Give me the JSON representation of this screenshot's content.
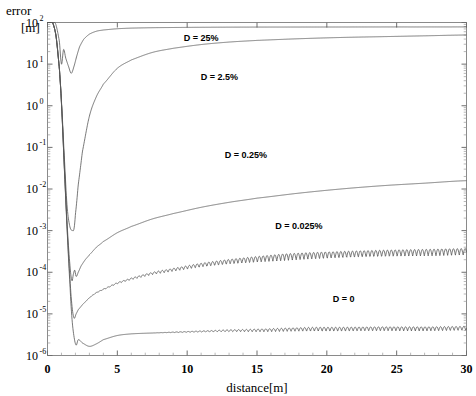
{
  "chart_data": {
    "type": "line",
    "title": "",
    "ylabel": "error",
    "yunit": "[m]",
    "xlabel": "distance[m]",
    "xlim": [
      0,
      30
    ],
    "ylim_exp": [
      -6,
      2
    ],
    "yscale": "log",
    "grid": false,
    "legend_position": "inline-annotations",
    "xticks": [
      "0",
      "5",
      "10",
      "15",
      "20",
      "25",
      "30"
    ],
    "xtick_values": [
      0,
      5,
      10,
      15,
      20,
      25,
      30
    ],
    "yticks": [
      {
        "mantissa": "10",
        "exponent": "2",
        "value": 100
      },
      {
        "mantissa": "10",
        "exponent": "1",
        "value": 10
      },
      {
        "mantissa": "10",
        "exponent": "0",
        "value": 1
      },
      {
        "mantissa": "10",
        "exponent": "-1",
        "value": 0.1
      },
      {
        "mantissa": "10",
        "exponent": "-2",
        "value": 0.01
      },
      {
        "mantissa": "10",
        "exponent": "-3",
        "value": 0.001
      },
      {
        "mantissa": "10",
        "exponent": "-4",
        "value": 0.0001
      },
      {
        "mantissa": "10",
        "exponent": "-5",
        "value": 1e-05
      },
      {
        "mantissa": "10",
        "exponent": "-6",
        "value": 1e-06
      }
    ],
    "series": [
      {
        "name": "D = 25%",
        "label": "D = 25%",
        "label_x": 11.0,
        "label_y_exp": 1.55,
        "color": "#555555",
        "x": [
          0.0,
          0.3,
          0.6,
          0.85,
          1.0,
          1.15,
          1.3,
          1.5,
          1.7,
          1.9,
          2.1,
          2.3,
          2.6,
          3.0,
          3.5,
          4.0,
          5.0,
          6.0,
          7.5,
          9.0,
          11.0,
          13.0,
          15.0,
          18.0,
          21.0,
          24.0,
          27.0,
          30.0
        ],
        "y_exp": [
          2.15,
          2.1,
          1.95,
          1.55,
          1.0,
          1.35,
          1.15,
          0.95,
          0.78,
          0.95,
          1.2,
          1.42,
          1.6,
          1.72,
          1.79,
          1.82,
          1.85,
          1.865,
          1.875,
          1.88,
          1.885,
          1.888,
          1.89,
          1.891,
          1.892,
          1.893,
          1.893,
          1.894
        ]
      },
      {
        "name": "D = 2.5%",
        "label": "D = 2.5%",
        "label_x": 12.3,
        "label_y_exp": 0.62,
        "color": "#555555",
        "x": [
          0.0,
          0.3,
          0.6,
          0.85,
          1.0,
          1.2,
          1.4,
          1.6,
          1.8,
          1.9,
          2.0,
          2.2,
          2.5,
          3.0,
          3.5,
          4.0,
          5.0,
          6.0,
          7.5,
          9.0,
          11.0,
          13.0,
          15.0,
          18.0,
          21.0,
          24.0,
          27.0,
          30.0
        ],
        "y_exp": [
          2.15,
          2.05,
          1.7,
          0.9,
          0.1,
          -1.2,
          -2.4,
          -2.9,
          -3.0,
          -2.95,
          -2.6,
          -1.9,
          -1.1,
          -0.25,
          0.22,
          0.52,
          0.9,
          1.1,
          1.28,
          1.38,
          1.47,
          1.53,
          1.57,
          1.61,
          1.64,
          1.66,
          1.68,
          1.7
        ]
      },
      {
        "name": "D = 0.25%",
        "label": "D = 0.25%",
        "label_x": 14.2,
        "label_y_exp": -1.25,
        "color": "#555555",
        "x": [
          0.0,
          0.3,
          0.6,
          0.85,
          1.0,
          1.2,
          1.4,
          1.6,
          1.75,
          1.85,
          1.95,
          2.05,
          2.2,
          2.4,
          2.7,
          3.0,
          3.5,
          4.0,
          5.0,
          6.0,
          7.5,
          9.0,
          11.0,
          13.0,
          15.0,
          18.0,
          21.0,
          24.0,
          27.0,
          30.0
        ],
        "y_exp": [
          2.15,
          2.05,
          1.7,
          0.9,
          0.05,
          -1.4,
          -2.8,
          -3.8,
          -4.2,
          -4.05,
          -3.95,
          -4.1,
          -4.0,
          -3.85,
          -3.7,
          -3.58,
          -3.4,
          -3.26,
          -3.05,
          -2.9,
          -2.72,
          -2.59,
          -2.44,
          -2.32,
          -2.22,
          -2.1,
          -2.0,
          -1.92,
          -1.86,
          -1.8
        ]
      },
      {
        "name": "D = 0.025%",
        "label": "D = 0.025%",
        "label_x": 18.0,
        "label_y_exp": -2.95,
        "color": "#555555",
        "oscillation_exp": 0.16,
        "oscillation_start": 2.2,
        "x": [
          0.0,
          0.3,
          0.6,
          0.85,
          1.0,
          1.2,
          1.4,
          1.6,
          1.75,
          1.9,
          2.05,
          2.2,
          2.5,
          3.0,
          3.5,
          4.0,
          5.0,
          6.0,
          7.5,
          9.0,
          11.0,
          13.0,
          15.0,
          18.0,
          21.0,
          24.0,
          27.0,
          30.0
        ],
        "y_exp": [
          2.15,
          2.05,
          1.7,
          0.9,
          0.05,
          -1.45,
          -2.9,
          -4.1,
          -4.8,
          -5.1,
          -5.0,
          -4.9,
          -4.78,
          -4.62,
          -4.5,
          -4.42,
          -4.28,
          -4.18,
          -4.06,
          -3.98,
          -3.88,
          -3.81,
          -3.76,
          -3.7,
          -3.66,
          -3.63,
          -3.61,
          -3.59
        ]
      },
      {
        "name": "D = 0",
        "label": "D = 0",
        "label_x": 21.2,
        "label_y_exp": -4.72,
        "color": "#555555",
        "oscillation_exp": 0.1,
        "oscillation_start": 7.5,
        "x": [
          0.0,
          0.3,
          0.6,
          0.85,
          1.0,
          1.2,
          1.4,
          1.6,
          1.75,
          1.9,
          2.05,
          2.2,
          2.5,
          3.0,
          3.5,
          4.0,
          5.0,
          6.0,
          7.5,
          9.0,
          11.0,
          13.0,
          15.0,
          18.0,
          21.0,
          24.0,
          27.0,
          30.0
        ],
        "y_exp": [
          2.15,
          2.05,
          1.7,
          0.9,
          0.05,
          -1.45,
          -2.95,
          -4.25,
          -5.1,
          -5.55,
          -5.75,
          -5.62,
          -5.7,
          -5.78,
          -5.72,
          -5.62,
          -5.52,
          -5.48,
          -5.46,
          -5.45,
          -5.44,
          -5.43,
          -5.43,
          -5.42,
          -5.42,
          -5.41,
          -5.41,
          -5.4
        ]
      }
    ]
  },
  "axis": {
    "ylabel_line1": "error",
    "ylabel_line2": "[m]",
    "xtitle": "distance[m]"
  }
}
